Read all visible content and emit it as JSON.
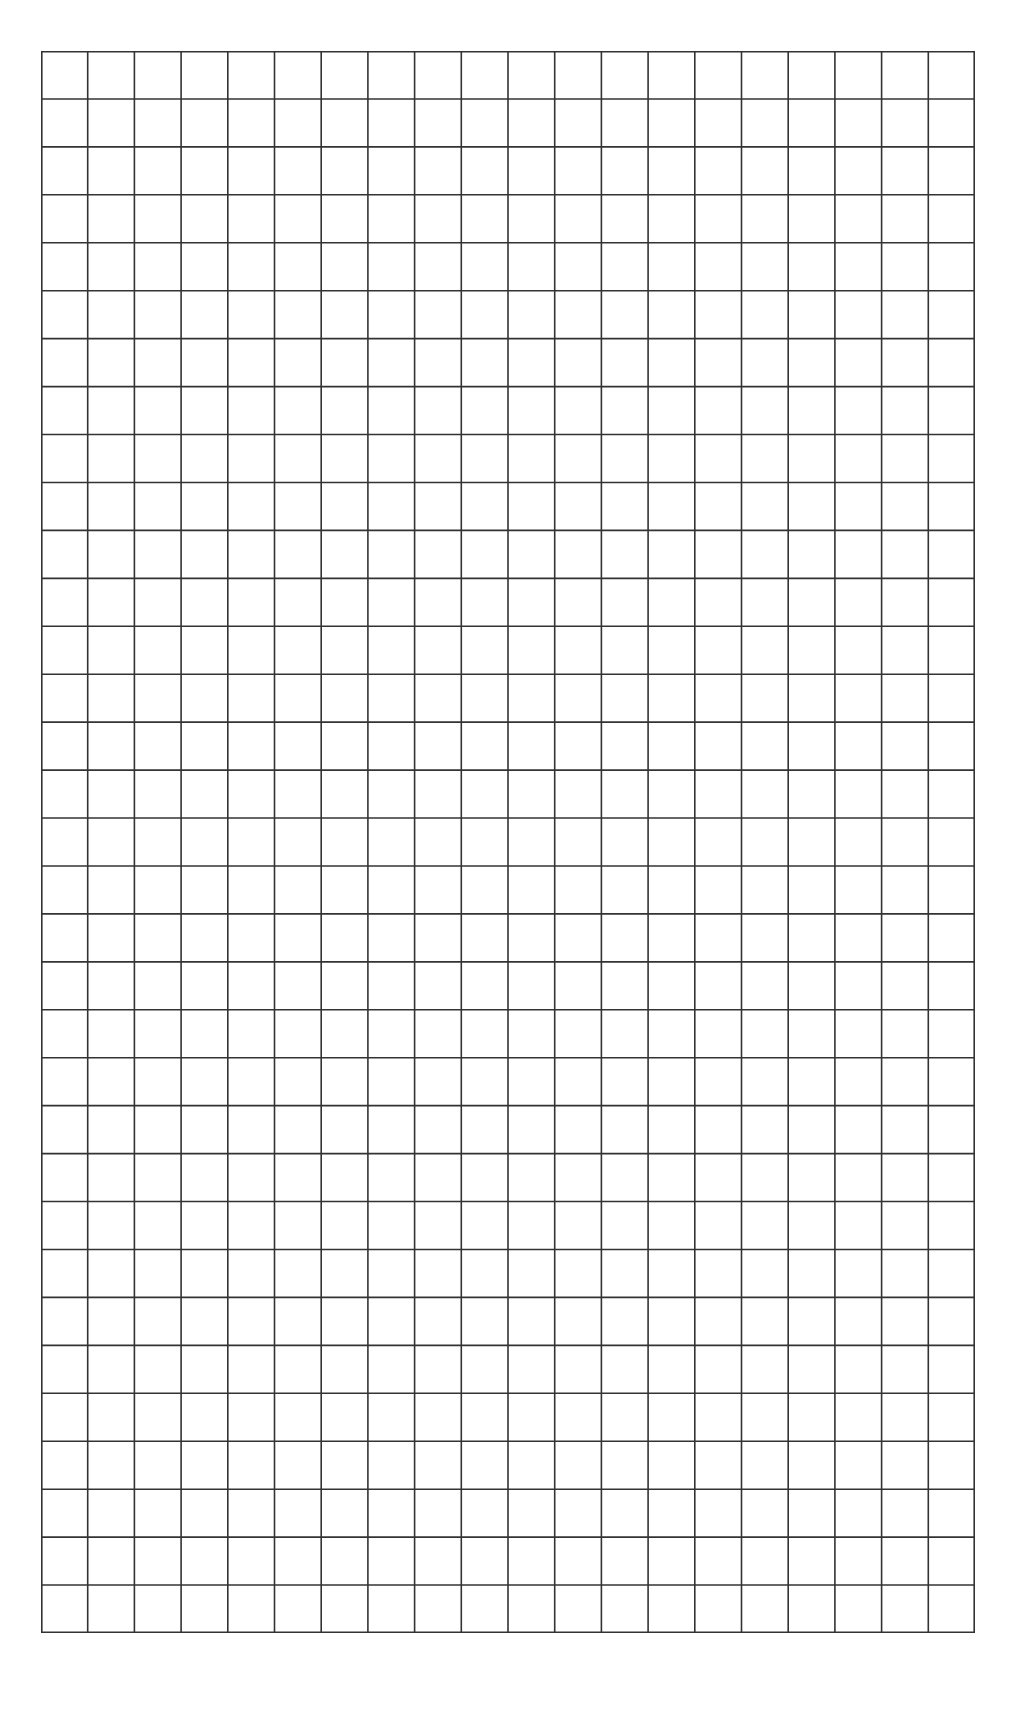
{
  "grid": {
    "columns": 20,
    "rows": 33,
    "line_color": "#333333",
    "background_color": "#ffffff",
    "line_width": 1.6,
    "bounds": {
      "left": 41,
      "top": 51,
      "width": 934,
      "height": 1582
    }
  }
}
